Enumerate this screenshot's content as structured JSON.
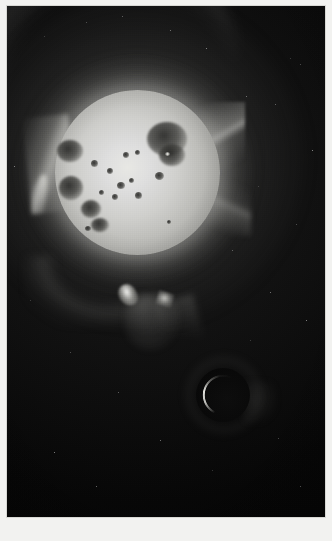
{
  "figure": {
    "kind": "astronomical-photograph",
    "medium": "grayscale plate",
    "frame": {
      "border_color": "#d8d8d4",
      "background_color": "#060606"
    }
  },
  "caption": {
    "text": ""
  },
  "sun": {
    "label": "solar-disk",
    "center_x_px": 130,
    "center_y_px": 166,
    "radius_px": 82,
    "core_color": "#e8e8e4",
    "limb_color": "#6a6a66"
  },
  "eclipse_body": {
    "label": "eclipsing-dark-body",
    "center_x_px": 216,
    "center_y_px": 389,
    "radius_px": 27,
    "body_color": "#090909",
    "rim_color": "#f0f0eb"
  },
  "sunspots": [
    {
      "id": "spot-group-ne",
      "x": 92,
      "y": 32,
      "w": 40,
      "h": 34
    },
    {
      "id": "spot-group-ne-lobe",
      "x": 104,
      "y": 54,
      "w": 26,
      "h": 22
    },
    {
      "id": "spot-group-w",
      "x": 2,
      "y": 50,
      "w": 26,
      "h": 22
    },
    {
      "id": "spot-group-w-lower",
      "x": 4,
      "y": 86,
      "w": 24,
      "h": 24
    },
    {
      "id": "spot-group-sw",
      "x": 26,
      "y": 110,
      "w": 20,
      "h": 18
    },
    {
      "id": "spot-group-s",
      "x": 36,
      "y": 128,
      "w": 18,
      "h": 14
    },
    {
      "id": "spot-pore-a",
      "x": 36,
      "y": 70,
      "w": 7,
      "h": 7
    },
    {
      "id": "spot-pore-b",
      "x": 52,
      "y": 78,
      "w": 6,
      "h": 6
    },
    {
      "id": "spot-pore-c",
      "x": 62,
      "y": 92,
      "w": 8,
      "h": 7
    },
    {
      "id": "spot-pore-d",
      "x": 74,
      "y": 88,
      "w": 5,
      "h": 5
    },
    {
      "id": "spot-pore-e",
      "x": 80,
      "y": 102,
      "w": 7,
      "h": 7
    },
    {
      "id": "spot-pore-f",
      "x": 57,
      "y": 104,
      "w": 6,
      "h": 6
    },
    {
      "id": "spot-pore-g",
      "x": 44,
      "y": 100,
      "w": 5,
      "h": 5
    },
    {
      "id": "spot-pore-h",
      "x": 68,
      "y": 62,
      "w": 6,
      "h": 6
    },
    {
      "id": "spot-pore-i",
      "x": 80,
      "y": 60,
      "w": 5,
      "h": 5
    },
    {
      "id": "spot-pore-j",
      "x": 100,
      "y": 82,
      "w": 9,
      "h": 8
    },
    {
      "id": "spot-pore-k",
      "x": 30,
      "y": 136,
      "w": 6,
      "h": 5
    },
    {
      "id": "spot-pore-l",
      "x": 112,
      "y": 130,
      "w": 4,
      "h": 4
    },
    {
      "id": "spot-facula",
      "x": 110,
      "y": 62,
      "w": 5,
      "h": 4
    }
  ],
  "stars": [
    {
      "x": 290,
      "y": 58,
      "d": 1.4
    },
    {
      "x": 300,
      "y": 64,
      "d": 1.2
    },
    {
      "x": 275,
      "y": 104,
      "d": 1.3
    },
    {
      "x": 246,
      "y": 96,
      "d": 1.0
    },
    {
      "x": 312,
      "y": 150,
      "d": 1.2
    },
    {
      "x": 258,
      "y": 186,
      "d": 1.0
    },
    {
      "x": 296,
      "y": 224,
      "d": 1.3
    },
    {
      "x": 232,
      "y": 250,
      "d": 1.0
    },
    {
      "x": 270,
      "y": 292,
      "d": 1.1
    },
    {
      "x": 306,
      "y": 320,
      "d": 1.0
    },
    {
      "x": 44,
      "y": 36,
      "d": 1.1
    },
    {
      "x": 86,
      "y": 22,
      "d": 1.0
    },
    {
      "x": 122,
      "y": 16,
      "d": 1.2
    },
    {
      "x": 170,
      "y": 30,
      "d": 1.0
    },
    {
      "x": 206,
      "y": 48,
      "d": 1.1
    },
    {
      "x": 30,
      "y": 300,
      "d": 1.0
    },
    {
      "x": 70,
      "y": 352,
      "d": 1.1
    },
    {
      "x": 118,
      "y": 392,
      "d": 1.0
    },
    {
      "x": 160,
      "y": 440,
      "d": 1.0
    },
    {
      "x": 54,
      "y": 452,
      "d": 1.2
    },
    {
      "x": 212,
      "y": 470,
      "d": 1.0
    },
    {
      "x": 278,
      "y": 438,
      "d": 1.1
    },
    {
      "x": 300,
      "y": 486,
      "d": 1.0
    },
    {
      "x": 96,
      "y": 486,
      "d": 1.0
    },
    {
      "x": 14,
      "y": 166,
      "d": 1.0
    },
    {
      "x": 250,
      "y": 340,
      "d": 1.0
    }
  ]
}
